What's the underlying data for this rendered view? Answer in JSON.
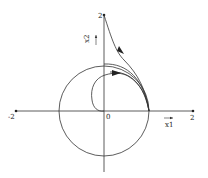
{
  "diagram": {
    "type": "phase-portrait",
    "axes": {
      "x_label": "x1",
      "y_label": "x2",
      "x_min_label": "-2",
      "x_max_label": "2",
      "y_max_label": "2",
      "origin_label": "0"
    },
    "unit_circle": {
      "center": [
        0,
        0
      ],
      "radius": 1
    },
    "trajectories": [
      {
        "name": "from (0,2)",
        "start": [
          0,
          2
        ],
        "end": [
          1,
          0
        ],
        "arrow": "downward-right"
      },
      {
        "name": "outer arc from (0,1)",
        "start": [
          0,
          1
        ],
        "end": [
          1,
          0
        ]
      },
      {
        "name": "spiral from origin",
        "start": [
          0,
          0
        ],
        "end": [
          1,
          0
        ],
        "arrow": "rightward"
      }
    ],
    "colors": {
      "stroke": "#333333",
      "background": "#ffffff"
    }
  }
}
